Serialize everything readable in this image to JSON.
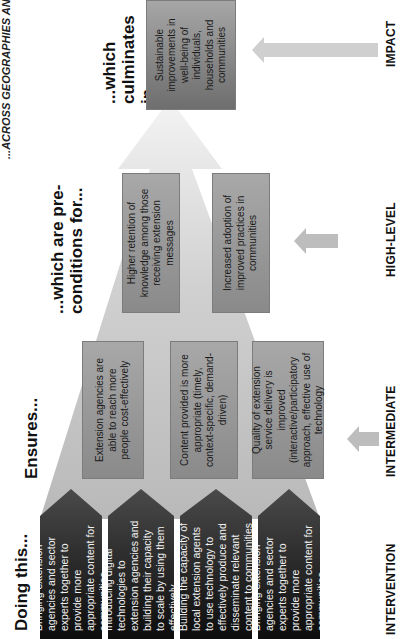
{
  "diagram": {
    "title": "...ACROSS GEOGRAPHIES AND SECTORS",
    "orientation": "rotated-90-ccw",
    "column_headers": {
      "intervention": "Doing this...",
      "intermediate": "Ensures...",
      "high_level": "...which are pre-conditions for...",
      "impact": "...which culminates in..."
    },
    "row_labels": {
      "intervention": "INTERVENTION",
      "intermediate": "INTERMEDIATE",
      "high_level": "HIGH-LEVEL",
      "impact": "IMPACT"
    },
    "interventions": [
      "Bringing extension agencies and sector experts together to provide more appropriate content for communities",
      "Introducing digital technologies to extension agencies and building their capacity to scale by using them effectively",
      "Building the capacity of local extension agents to use technology to effectively produce and disseminate relevant content to communities",
      "Bringing extension agencies and sector experts together to provide more appropriate content for communities"
    ],
    "intermediate_outcomes": [
      "Extension agencies are able to reach more people cost-effectively",
      "Content provided is more appropriate (timely, context-specific, demand-driven)",
      "Quality of extension service delivery is improved (interactive/participatory approach, effective use of technology"
    ],
    "high_level_outcomes": [
      "Higher retention of knowledge among those receiving extension messages",
      "Increased adoption of improved practices in communities"
    ],
    "impact": "Sustainable improvements in well-being of individuals, households and communities",
    "colors": {
      "intervention_dark": "#0d0d0d",
      "intervention_light": "#4a4a4a",
      "outcome_box": "#9a9a9a",
      "pyramid_fill": "#c8c8c8",
      "pyramid_light": "#ececec",
      "arrow": "#c4c4c4",
      "text_dark": "#111111",
      "text_light": "#f2f2f2"
    }
  }
}
